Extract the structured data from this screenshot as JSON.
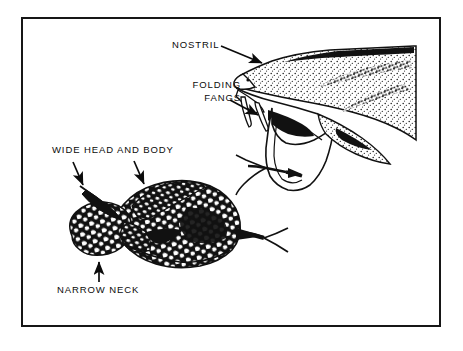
{
  "figure": {
    "kind": "line-art-illustration",
    "background_color": "#ffffff",
    "ink_color": "#111111",
    "frame": {
      "name": "rectangular-border",
      "color": "#161616",
      "stroke_px": 2,
      "x": 21,
      "y": 17,
      "width": 420,
      "height": 310
    }
  },
  "labels": {
    "nostril": "NOSTRIL",
    "folding_line1": "FOLDING",
    "folding_line2": "FANGS",
    "wide_head_and_body": "WIDE HEAD AND BODY",
    "narrow_neck": "NARROW NECK"
  },
  "drawings": [
    {
      "name": "snake-head-open-mouth",
      "description": "side view of viper head with open jaws, folding fangs and forked tongue",
      "region": {
        "x": 232,
        "y": 40,
        "width": 185,
        "height": 165
      }
    },
    {
      "name": "snake-coiled-body",
      "description": "mottled wide-bodied snake with narrow neck and forked tongue",
      "region": {
        "x": 40,
        "y": 175,
        "width": 220,
        "height": 110
      }
    }
  ],
  "leader_arrows": [
    {
      "name": "arrow-nostril",
      "points_to": "nostril",
      "direction": "down-right"
    },
    {
      "name": "arrow-folding-fangs",
      "points_to": "fangs",
      "direction": "down-right"
    },
    {
      "name": "arrow-wide-head",
      "points_to": "head",
      "direction": "down-right"
    },
    {
      "name": "arrow-wide-body",
      "points_to": "body",
      "direction": "down-right"
    },
    {
      "name": "arrow-narrow-neck",
      "points_to": "neck",
      "direction": "up"
    }
  ]
}
